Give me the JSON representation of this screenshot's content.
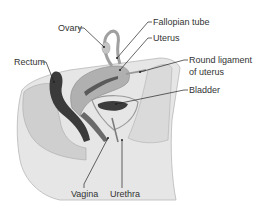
{
  "diagram": {
    "colors": {
      "background": "#ffffff",
      "skin": "#e2e2e2",
      "tissue_light": "#d4d4d4",
      "tissue_mid": "#a8a8a8",
      "tissue_dark": "#3a3a3a",
      "leader_line": "#222222",
      "label_text": "#333333"
    },
    "labels": [
      {
        "id": "ovary",
        "text": "Ovary"
      },
      {
        "id": "fallopian-tube",
        "text": "Fallopian tube"
      },
      {
        "id": "uterus",
        "text": "Uterus"
      },
      {
        "id": "rectum",
        "text": "Rectum"
      },
      {
        "id": "round-ligament-line1",
        "text": "Round ligament"
      },
      {
        "id": "round-ligament-line2",
        "text": "of uterus"
      },
      {
        "id": "bladder",
        "text": "Bladder"
      },
      {
        "id": "vagina",
        "text": "Vagina"
      },
      {
        "id": "urethra",
        "text": "Urethra"
      }
    ]
  }
}
